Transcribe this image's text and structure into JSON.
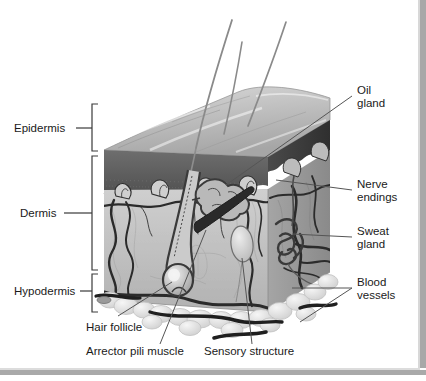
{
  "figure": {
    "title_sliver": "",
    "type": "anatomical-illustration",
    "style": "grayscale 3D block diagram"
  },
  "layer_labels": [
    {
      "id": "epidermis",
      "text": "Epidermis",
      "side": "left",
      "bracket": true
    },
    {
      "id": "dermis",
      "text": "Dermis",
      "side": "left",
      "bracket": true
    },
    {
      "id": "hypodermis",
      "text": "Hypodermis",
      "side": "left",
      "bracket": true
    }
  ],
  "structure_labels": [
    {
      "id": "oil-gland",
      "line1": "Oil",
      "line2": "gland",
      "side": "right"
    },
    {
      "id": "nerve-endings",
      "line1": "Nerve",
      "line2": "endings",
      "side": "right"
    },
    {
      "id": "sweat-gland",
      "line1": "Sweat",
      "line2": "gland",
      "side": "right"
    },
    {
      "id": "blood-vessels",
      "line1": "Blood",
      "line2": "vessels",
      "side": "right"
    },
    {
      "id": "hair-follicle",
      "line1": "Hair follicle",
      "line2": "",
      "side": "bottom"
    },
    {
      "id": "arrector-pili-muscle",
      "line1": "Arrector pili muscle",
      "line2": "",
      "side": "bottom"
    },
    {
      "id": "sensory-structure",
      "line1": "Sensory structure",
      "line2": "",
      "side": "bottom"
    }
  ],
  "colors": {
    "page_background": "#ffffff",
    "frame_gray": "#a8a8a8",
    "epidermis_dark": "#5d5d5d",
    "epidermis_surface": "#c9c9c9",
    "dermis_fill": "#bdbdbd",
    "dermis_side": "#9e9e9e",
    "hypodermis_fat": "#e2e2e2",
    "structure_outline": "#3a3a3a",
    "label_text": "#1a1a1a",
    "leader_line": "#555555"
  }
}
